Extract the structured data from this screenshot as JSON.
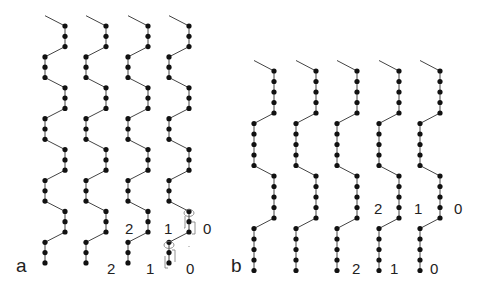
{
  "figure": {
    "colors": {
      "line": "#444444",
      "dot": "#111111",
      "label": "#222222",
      "annotation": "#777777"
    }
  },
  "panel_a": {
    "label": "a",
    "columns": [
      {
        "left_x": 45,
        "right_x": 65
      },
      {
        "left_x": 86,
        "right_x": 106
      },
      {
        "left_x": 128,
        "right_x": 148
      },
      {
        "left_x": 169,
        "right_x": 189
      }
    ],
    "dots_per_segment": 3,
    "mid_labels": [
      "2",
      "1",
      "0"
    ],
    "bottom_labels": [
      "2",
      "1",
      "0"
    ]
  },
  "panel_b": {
    "label": "b",
    "columns": [
      {
        "left_x": 254,
        "right_x": 274
      },
      {
        "left_x": 296,
        "right_x": 316
      },
      {
        "left_x": 337,
        "right_x": 357
      },
      {
        "left_x": 379,
        "right_x": 399
      },
      {
        "left_x": 420,
        "right_x": 440
      }
    ],
    "dots_per_segment": 5,
    "mid_labels": [
      "2",
      "1",
      "0"
    ],
    "bottom_labels": [
      "2",
      "1",
      "0"
    ]
  }
}
